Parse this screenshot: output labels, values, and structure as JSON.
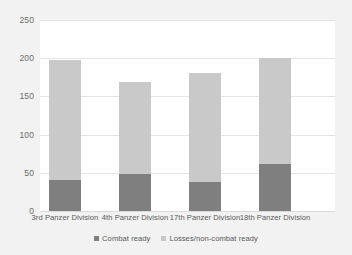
{
  "chart_data": {
    "type": "bar",
    "subtype": "stacked",
    "title": "",
    "xlabel": "",
    "ylabel": "",
    "categories": [
      "3rd Panzer Division",
      "4th Panzer Division",
      "17th Panzer Division",
      "18th Panzer Division"
    ],
    "series": [
      {
        "name": "Combat ready",
        "color": "#7f7f7f",
        "values": [
          40,
          49,
          38,
          62
        ]
      },
      {
        "name": "Losses/non-combat ready",
        "color": "#c9c9c9",
        "values": [
          158,
          120,
          142,
          138
        ]
      }
    ],
    "totals": [
      198,
      169,
      180,
      200
    ],
    "ylim": [
      0,
      250
    ],
    "yticks": [
      0,
      50,
      100,
      150,
      200,
      250
    ],
    "ytick_labels": [
      "0",
      "50",
      "100",
      "150",
      "200",
      "250"
    ],
    "grid": true,
    "legend_position": "bottom"
  },
  "legend": {
    "items": [
      {
        "label": "Combat ready",
        "swatch": "dark"
      },
      {
        "label": "Losses/non-combat ready",
        "swatch": "light"
      }
    ]
  },
  "colors": {
    "combat_ready": "#7f7f7f",
    "losses_non_combat_ready": "#c9c9c9",
    "plot_background": "#ffffff",
    "page_background": "#f2f2f2",
    "gridline": "#e4e4e4",
    "axis_text": "#595959"
  }
}
